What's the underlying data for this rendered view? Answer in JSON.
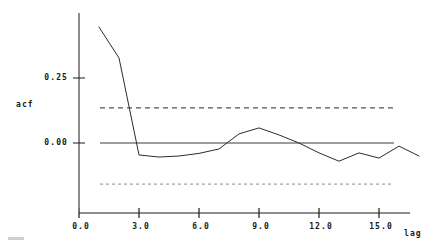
{
  "chart_data": {
    "type": "line",
    "title": "",
    "xlabel": "lag",
    "ylabel": "acf",
    "xlim": [
      -0.6,
      18.0
    ],
    "ylim": [
      -0.215,
      0.47
    ],
    "grid": false,
    "legend": null,
    "x_ticks": [
      {
        "value": 0,
        "label": "0.0"
      },
      {
        "value": 3,
        "label": "3.0"
      },
      {
        "value": 6,
        "label": "6.0"
      },
      {
        "value": 9,
        "label": "9.0"
      },
      {
        "value": 12,
        "label": "12.0"
      },
      {
        "value": 15,
        "label": "15.0"
      }
    ],
    "y_ticks": [
      {
        "value": 0.25,
        "label": "0.25"
      },
      {
        "value": 0.0,
        "label": "0.00"
      }
    ],
    "series": [
      {
        "name": "acf",
        "x": [
          1,
          2,
          3,
          4,
          5,
          6,
          7,
          8,
          9,
          10,
          11,
          12,
          13,
          14,
          15,
          16,
          17
        ],
        "values": [
          0.446,
          0.327,
          -0.046,
          -0.054,
          -0.05,
          -0.04,
          -0.023,
          0.035,
          0.058,
          0.031,
          0.0,
          -0.038,
          -0.07,
          -0.038,
          -0.058,
          -0.012,
          -0.05
        ]
      }
    ],
    "reference_lines": [
      {
        "name": "zero-line",
        "value": 0.0,
        "style": "solid"
      },
      {
        "name": "upper-confidence-bound",
        "value": 0.135,
        "style": "dashed"
      },
      {
        "name": "lower-confidence-bound",
        "value": -0.158,
        "style": "dashed"
      }
    ]
  },
  "colors": {
    "series": "#2b2b2b",
    "axis": "#1a1a1a",
    "reference_solid": "#3a3a3a",
    "reference_dashed": "#2b2b2b",
    "reference_dashed_lower": "#8a8a8a",
    "background": "#ffffff"
  },
  "axes": {
    "x_axis_title": "lag",
    "y_axis_title": "acf"
  }
}
